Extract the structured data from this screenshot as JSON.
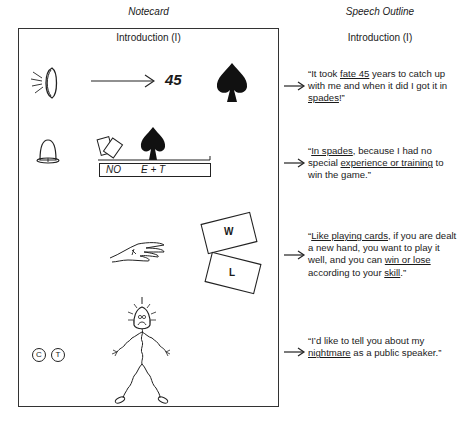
{
  "headers": {
    "left": "Notecard",
    "right": "Speech Outline"
  },
  "notecard": {
    "title": "Introduction (I)",
    "row1": {
      "icons": [
        "eye-icon",
        "arrow-right-icon",
        "spade-icon"
      ],
      "number": "45"
    },
    "row2": {
      "icons": [
        "bell-icon",
        "cards-icon",
        "spade-icon"
      ],
      "label_left": "NO",
      "label_right": "E + T"
    },
    "row3": {
      "icons": [
        "hand-icon"
      ],
      "card_top": "W",
      "card_bottom": "L"
    },
    "row4": {
      "icons": [
        "stick-figure-icon"
      ],
      "circle_letters": [
        "C",
        "T"
      ]
    }
  },
  "outline": {
    "title": "Introduction (I)",
    "quotes": [
      {
        "segments": [
          {
            "t": "“It took ",
            "u": false
          },
          {
            "t": "fate 45",
            "u": true
          },
          {
            "t": " years to catch up with me and when it did I got it in ",
            "u": false
          },
          {
            "t": "spades",
            "u": true
          },
          {
            "t": "!”",
            "u": false
          }
        ]
      },
      {
        "segments": [
          {
            "t": "“",
            "u": false
          },
          {
            "t": "In spades",
            "u": true
          },
          {
            "t": ", because I had no special ",
            "u": false
          },
          {
            "t": "experience or training",
            "u": true
          },
          {
            "t": " to win the game.”",
            "u": false
          }
        ]
      },
      {
        "segments": [
          {
            "t": "“",
            "u": false
          },
          {
            "t": "Like playing cards",
            "u": true
          },
          {
            "t": ", if you are dealt a new hand, you want to play it well, and you can ",
            "u": false
          },
          {
            "t": "win or lose",
            "u": true
          },
          {
            "t": " according to your ",
            "u": false
          },
          {
            "t": "skill",
            "u": true
          },
          {
            "t": ".”",
            "u": false
          }
        ]
      },
      {
        "segments": [
          {
            "t": "“I’d like to tell you about my ",
            "u": false
          },
          {
            "t": "nightmare",
            "u": true
          },
          {
            "t": " as a public speaker.”",
            "u": false
          }
        ]
      }
    ]
  }
}
